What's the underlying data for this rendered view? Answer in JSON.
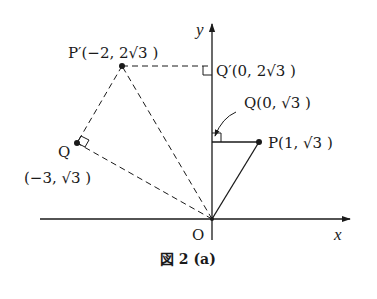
{
  "figure": {
    "caption": "図 2 (a)",
    "axes": {
      "x_label": "x",
      "y_label": "y",
      "origin_label": "O"
    },
    "points": {
      "P": {
        "label": "P(1, √3 )",
        "x": 1,
        "y": 1.732
      },
      "Q": {
        "label": "Q(0, √3 )",
        "x": 0,
        "y": 1.732
      },
      "P_prime": {
        "label": "P′(−2, 2√3 )",
        "x": -2,
        "y": 3.464
      },
      "Q_prime": {
        "label": "Q′(0, 2√3 )",
        "x": 0,
        "y": 3.464
      },
      "Q_left": {
        "label_name": "Q",
        "label_coords": "(−3, √3 )",
        "x": -3,
        "y": 1.732
      }
    }
  }
}
